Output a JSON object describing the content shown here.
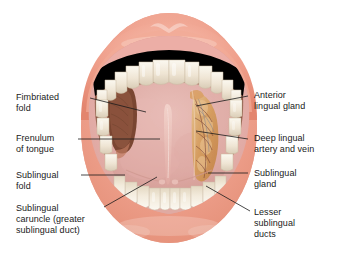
{
  "figure": {
    "view": "open mouth, ventral (under) surface of tongue",
    "background_color": "#ffffff"
  },
  "palette": {
    "lip_outer": "#e8927c",
    "lip_mid": "#f0a894",
    "lip_highlight": "#f7cbbd",
    "gum_pink": "#e8918a",
    "gum_light": "#f0b3aa",
    "tooth_base": "#efe6d6",
    "tooth_shadow": "#d8cbb5",
    "tooth_highlight": "#faf6ec",
    "mucosa_pink": "#e0a8a4",
    "mucosa_pale": "#e9bdb8",
    "floor_pink": "#ddaaa6",
    "tongue_underside": "#8a5443",
    "tongue_dark": "#6e4030",
    "fimbriated_dark": "#7d4a38",
    "gland_orange": "#d9a066",
    "gland_tan": "#e8c08a",
    "vessel_dark": "#7a4a3a",
    "vessel_blue": "#6e7a94",
    "frenulum": "#e9c3bc",
    "leader_line": "#1a1a1a",
    "text": "#1a1a1a"
  },
  "labels": [
    {
      "id": "fimbriated-fold",
      "text": "Fimbriated\nfold",
      "side": "left",
      "x": 16,
      "y": 92,
      "leader": {
        "x1": 90,
        "y1": 98,
        "x2": 146,
        "y2": 112
      }
    },
    {
      "id": "frenulum-of-tongue",
      "text": "Frenulum\nof tongue",
      "side": "left",
      "x": 16,
      "y": 133,
      "leader": {
        "x1": 78,
        "y1": 139,
        "x2": 160,
        "y2": 139
      }
    },
    {
      "id": "sublingual-fold",
      "text": "Sublingual\nfold",
      "side": "left",
      "x": 16,
      "y": 170,
      "leader": {
        "x1": 81,
        "y1": 175,
        "x2": 125,
        "y2": 175
      }
    },
    {
      "id": "sublingual-caruncle",
      "text": "Sublingual\ncaruncle (greater\nsublingual duct)",
      "side": "left",
      "x": 16,
      "y": 203,
      "leader": {
        "x1": 104,
        "y1": 207,
        "x2": 157,
        "y2": 176
      }
    },
    {
      "id": "anterior-lingual-gland",
      "text": "Anterior\nlingual gland",
      "side": "right",
      "x": 254,
      "y": 90,
      "leader": {
        "x1": 248,
        "y1": 96,
        "x2": 196,
        "y2": 106
      }
    },
    {
      "id": "deep-lingual-artery-and-vein",
      "text": "Deep lingual\nartery and vein",
      "side": "right",
      "x": 254,
      "y": 133,
      "leader": {
        "x1": 248,
        "y1": 139,
        "x2": 196,
        "y2": 131
      }
    },
    {
      "id": "sublingual-gland",
      "text": "Sublingual\ngland",
      "side": "right",
      "x": 254,
      "y": 168,
      "leader": {
        "x1": 248,
        "y1": 173,
        "x2": 208,
        "y2": 173
      }
    },
    {
      "id": "lesser-sublingual-ducts",
      "text": "Lesser\nsublingual\nducts",
      "side": "right",
      "x": 254,
      "y": 207,
      "leader": {
        "x1": 250,
        "y1": 211,
        "x2": 206,
        "y2": 186
      }
    }
  ],
  "structures": [
    {
      "id": "upper-lip",
      "name": "upper lip"
    },
    {
      "id": "lower-lip",
      "name": "lower lip"
    },
    {
      "id": "upper-teeth",
      "name": "upper dental arch",
      "count": 10
    },
    {
      "id": "lower-teeth",
      "name": "lower dental arch",
      "count": 8
    },
    {
      "id": "tongue-ventral",
      "name": "ventral surface of tongue"
    },
    {
      "id": "frenulum",
      "name": "lingual frenulum"
    },
    {
      "id": "sublingual-gland-dissected",
      "name": "sublingual gland (dissected)"
    },
    {
      "id": "fimbriated-fold-structure",
      "name": "fimbriated fold"
    },
    {
      "id": "floor-of-mouth",
      "name": "floor of oral cavity"
    }
  ]
}
